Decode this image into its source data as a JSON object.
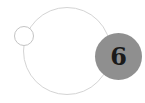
{
  "badge": {
    "number": "6",
    "fill_color": "#8f8f8f",
    "text_color": "#1a1a1a"
  },
  "rings": {
    "stroke_color": "#d4d4d4"
  }
}
